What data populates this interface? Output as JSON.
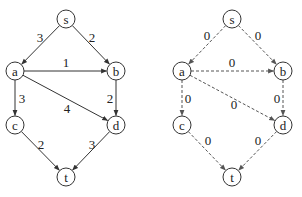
{
  "graphs": [
    {
      "id": "left",
      "style": "solid",
      "nodes": {
        "s": {
          "label": "s",
          "x": 66,
          "y": 19
        },
        "a": {
          "label": "a",
          "x": 15,
          "y": 71
        },
        "b": {
          "label": "b",
          "x": 116,
          "y": 71
        },
        "c": {
          "label": "c",
          "x": 15,
          "y": 125
        },
        "d": {
          "label": "d",
          "x": 116,
          "y": 125
        },
        "t": {
          "label": "t",
          "x": 66,
          "y": 177
        }
      },
      "edges": [
        {
          "from": "s",
          "to": "a",
          "weight": "3",
          "lx": 40,
          "ly": 37
        },
        {
          "from": "s",
          "to": "b",
          "weight": "2",
          "lx": 92,
          "ly": 37
        },
        {
          "from": "a",
          "to": "b",
          "weight": "1",
          "lx": 66,
          "ly": 62
        },
        {
          "from": "a",
          "to": "c",
          "weight": "3",
          "lx": 22,
          "ly": 98
        },
        {
          "from": "a",
          "to": "d",
          "weight": "4",
          "lx": 67,
          "ly": 108
        },
        {
          "from": "b",
          "to": "d",
          "weight": "2",
          "lx": 110,
          "ly": 98
        },
        {
          "from": "c",
          "to": "t",
          "weight": "2",
          "lx": 41,
          "ly": 144
        },
        {
          "from": "d",
          "to": "t",
          "weight": "3",
          "lx": 92,
          "ly": 144
        }
      ]
    },
    {
      "id": "right",
      "style": "dashed",
      "nodes": {
        "s": {
          "label": "s",
          "x": 232,
          "y": 19
        },
        "a": {
          "label": "a",
          "x": 182,
          "y": 71
        },
        "b": {
          "label": "b",
          "x": 283,
          "y": 71
        },
        "c": {
          "label": "c",
          "x": 182,
          "y": 125
        },
        "d": {
          "label": "d",
          "x": 283,
          "y": 125
        },
        "t": {
          "label": "t",
          "x": 232,
          "y": 177
        }
      },
      "edges": [
        {
          "from": "s",
          "to": "a",
          "weight": "0",
          "lx": 207,
          "ly": 35
        },
        {
          "from": "s",
          "to": "b",
          "weight": "0",
          "lx": 258,
          "ly": 35
        },
        {
          "from": "a",
          "to": "b",
          "weight": "0",
          "lx": 232,
          "ly": 62
        },
        {
          "from": "a",
          "to": "c",
          "weight": "0",
          "lx": 188,
          "ly": 98
        },
        {
          "from": "a",
          "to": "d",
          "weight": "0",
          "lx": 234,
          "ly": 104
        },
        {
          "from": "b",
          "to": "d",
          "weight": "0",
          "lx": 277,
          "ly": 98
        },
        {
          "from": "c",
          "to": "t",
          "weight": "0",
          "lx": 208,
          "ly": 140
        },
        {
          "from": "d",
          "to": "t",
          "weight": "0",
          "lx": 258,
          "ly": 140
        }
      ]
    }
  ],
  "node_radius": 9,
  "colors": {
    "stroke": "#333333",
    "dashed_stroke": "#555555",
    "text": "#222222"
  }
}
